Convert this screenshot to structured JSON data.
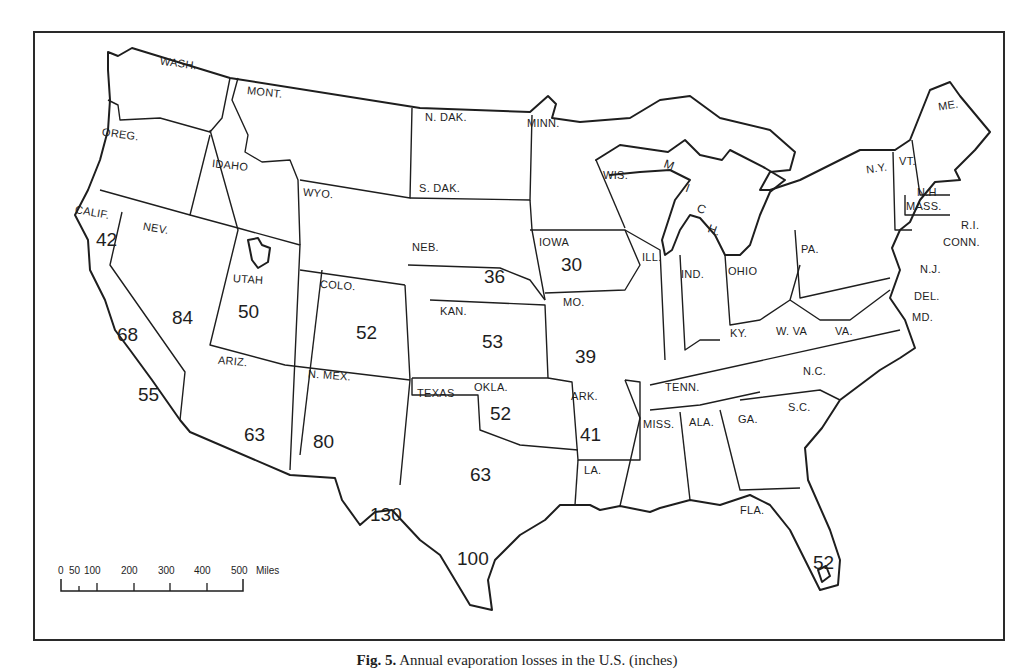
{
  "caption": {
    "fig": "Fig. 5.",
    "text": "Annual evaporation losses in the U.S. (inches)"
  },
  "scale_bar": {
    "ticks": [
      "0",
      "50",
      "100",
      "200",
      "300",
      "400",
      "500"
    ],
    "unit": "Miles"
  },
  "states": {
    "wash": "WASH.",
    "oreg": "OREG.",
    "calif": "CALIF.",
    "idaho": "IDAHO",
    "nev": "NEV.",
    "mont": "MONT.",
    "wyo": "WYO.",
    "utah": "UTAH",
    "colo": "COLO.",
    "ariz": "ARIZ.",
    "nmex": "N. MEX.",
    "ndak": "N. DAK.",
    "sdak": "S. DAK.",
    "neb": "NEB.",
    "kan": "KAN.",
    "okla": "OKLA.",
    "texas": "TEXAS",
    "minn": "MINN.",
    "iowa": "IOWA",
    "mo": "MO.",
    "ark": "ARK.",
    "la": "LA.",
    "wis": "WIS.",
    "ill": "ILL.",
    "ind": "IND.",
    "ohio": "OHIO",
    "ky": "KY.",
    "tenn": "TENN.",
    "miss": "MISS.",
    "ala": "ALA.",
    "ga": "GA.",
    "fla": "FLA.",
    "sc": "S.C.",
    "nc": "N.C.",
    "va": "VA.",
    "wva": "W. VA",
    "pa": "PA.",
    "ny": "N.Y.",
    "vt": "VT.",
    "nh": "N.H",
    "me": "ME.",
    "mass": "MASS.",
    "ri": "R.I.",
    "conn": "CONN.",
    "nj": "N.J.",
    "del": "DEL.",
    "md": "MD."
  },
  "michigan_letters": [
    "M",
    "I",
    "C",
    "H."
  ],
  "values": {
    "calif_north": "42",
    "calif_central": "68",
    "calif_south": "55",
    "nev": "84",
    "utah": "50",
    "colo": "52",
    "ariz": "63",
    "nmex": "80",
    "neb": "36",
    "iowa": "30",
    "kan": "53",
    "mo": "39",
    "okla": "52",
    "ark": "41",
    "texas_central": "63",
    "texas_west": "130",
    "texas_south": "100",
    "fla": "52"
  }
}
